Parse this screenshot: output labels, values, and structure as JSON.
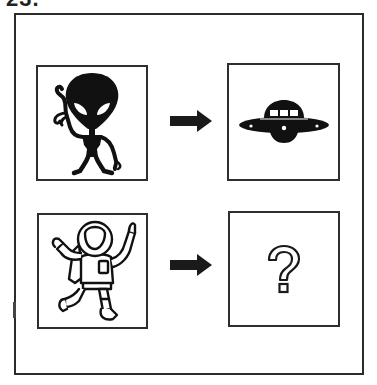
{
  "worksheet": {
    "question_number": "23.",
    "type": "visual analogy",
    "colors": {
      "ink": "#1a1a1a",
      "frame": "#2b2b2b",
      "background": "#ffffff"
    }
  },
  "rows": [
    {
      "left": {
        "label": "alien",
        "icon": "alien-icon"
      },
      "arrow": "right-arrow-icon",
      "right": {
        "label": "ufo",
        "icon": "ufo-icon"
      }
    },
    {
      "left": {
        "label": "astronaut",
        "icon": "astronaut-icon"
      },
      "arrow": "right-arrow-icon",
      "right": {
        "label": "?",
        "icon": "question-mark-icon"
      }
    }
  ],
  "answer_placeholder": "?"
}
